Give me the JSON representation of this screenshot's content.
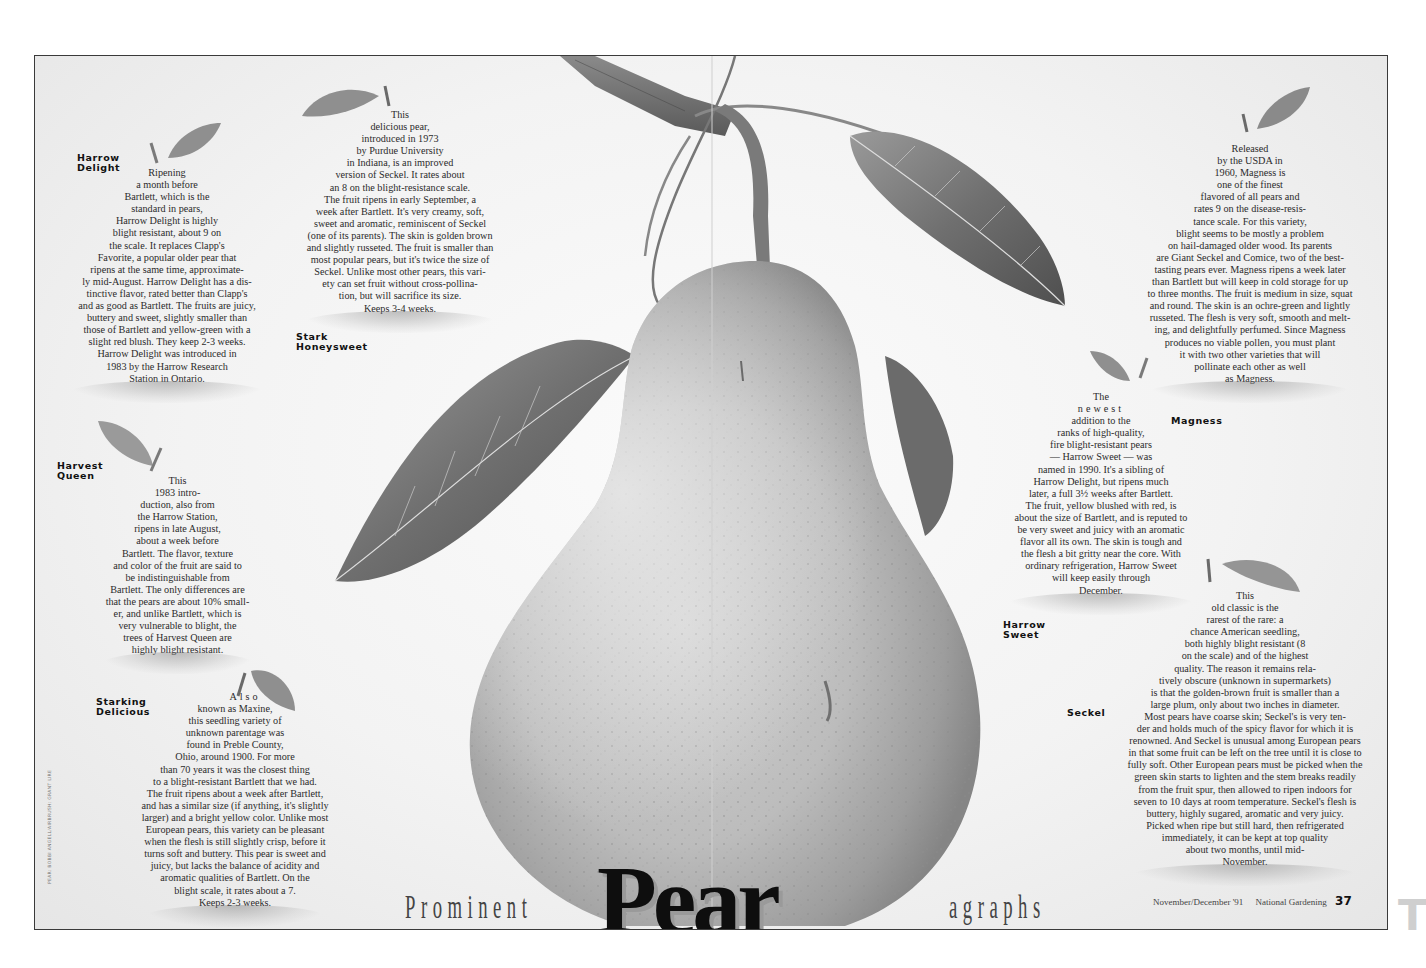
{
  "title": {
    "prefix": "Prominent",
    "main": "Pear",
    "suffix": "agraphs"
  },
  "footer": {
    "issue": "November/December '91",
    "publication": "National Gardening",
    "page_number": "37"
  },
  "credit": "PEAR: BOBBI ANGELL/AIRBRUSH: GRANT LIRE",
  "edge_tab": "T",
  "varieties": [
    {
      "name_lines": [
        "Harrow",
        "Delight"
      ],
      "lines": [
        "Ripening",
        "a month before",
        "Bartlett, which is the",
        "standard in pears,",
        "Harrow Delight is highly",
        "blight resistant, about 9 on",
        "the scale. It replaces Clapp's",
        "Favorite, a popular older pear that",
        "ripens at the same time, approximate-",
        "ly mid-August. Harrow Delight has a dis-",
        "tinctive flavor, rated better than Clapp's",
        "and as good as Bartlett. The fruits are juicy,",
        "buttery and sweet, slightly smaller than",
        "those of Bartlett and yellow-green with a",
        "slight red blush. They keep 2-3 weeks.",
        "Harrow Delight was introduced in",
        "1983 by the Harrow Research",
        "Station in Ontario."
      ]
    },
    {
      "name_lines": [
        "Stark",
        "Honeysweet"
      ],
      "lines": [
        "This",
        "delicious pear,",
        "introduced in 1973",
        "by Purdue University",
        "in Indiana, is an improved",
        "version of Seckel. It rates about",
        "an 8 on the blight-resistance scale.",
        "The fruit ripens in early September, a",
        "week after Bartlett. It's very creamy, soft,",
        "sweet and aromatic, reminiscent of Seckel",
        "(one of its parents). The skin is golden brown",
        "and slightly russeted. The fruit is smaller than",
        "most popular pears, but it's twice the size of",
        "Seckel. Unlike most other pears, this vari-",
        "ety can set fruit without cross-pollina-",
        "tion, but will sacrifice its size.",
        "Keeps 3-4 weeks."
      ]
    },
    {
      "name_lines": [
        "Harvest",
        "Queen"
      ],
      "lines": [
        "This",
        "1983 intro-",
        "duction, also from",
        "the Harrow Station,",
        "ripens in late August,",
        "about a week before",
        "Bartlett. The flavor, texture",
        "and color of the fruit are said to",
        "be indistinguishable from",
        "Bartlett. The only differences are",
        "that the pears are about 10% small-",
        "er, and unlike Bartlett, which is",
        "very vulnerable to blight, the",
        "trees of Harvest Queen are",
        "highly blight resistant."
      ]
    },
    {
      "name_lines": [
        "Starking",
        "Delicious"
      ],
      "lines": [
        "Also",
        "known as Maxine,",
        "this seedling variety of",
        "unknown parentage was",
        "found in Preble County,",
        "Ohio, around 1900. For more",
        "than 70 years it was the closest thing",
        "to a blight-resistant Bartlett that we had.",
        "The fruit ripens about a week after Bartlett,",
        "and has a similar size (if anything, it's slightly",
        "larger) and a bright yellow color. Unlike most",
        "European pears, this variety can be pleasant",
        "when the flesh is still slightly crisp, before it",
        "turns soft and buttery. This pear is sweet and",
        "juicy, but lacks the balance of acidity and",
        "aromatic qualities of Bartlett. On the",
        "blight scale, it rates about a 7.",
        "Keeps 2-3 weeks."
      ]
    },
    {
      "name_lines": [
        "Magness"
      ],
      "lines": [
        "Released",
        "by the USDA in",
        "1960, Magness is",
        "one of the finest",
        "flavored of all pears and",
        "rates 9 on the disease-resis-",
        "tance scale. For this variety,",
        "blight seems to be mostly a problem",
        "on hail-damaged older wood. Its parents",
        "are Giant Seckel and Comice, two of the best-",
        "tasting pears ever. Magness ripens a week later",
        "than Bartlett but will keep in cold storage for up",
        "to three months. The fruit is medium in size, squat",
        "and round. The skin is an ochre-green and lightly",
        "russeted. The flesh is very soft, smooth and melt-",
        "ing, and delightfully perfumed. Since Magness",
        "produces no viable pollen, you must plant",
        "it with two other varieties that will",
        "pollinate each other as well",
        "as Magness."
      ]
    },
    {
      "name_lines": [
        "Harrow",
        "Sweet"
      ],
      "lines": [
        "The",
        "newest",
        "addition to the",
        "ranks of high-quality,",
        "fire blight-resistant pears",
        "— Harrow Sweet — was",
        "named in 1990. It's a sibling of",
        "Harrow Delight, but ripens much",
        "later, a full 3½ weeks after Bartlett.",
        "The fruit, yellow blushed with red, is",
        "about the size of Bartlett, and is reputed to",
        "be very sweet and juicy with an aromatic",
        "flavor all its own. The skin is tough and",
        "the flesh a bit gritty near the core. With",
        "ordinary refrigeration, Harrow Sweet",
        "will keep easily through",
        "December."
      ]
    },
    {
      "name_lines": [
        "Seckel"
      ],
      "lines": [
        "This",
        "old classic is the",
        "rarest of the rare: a",
        "chance American seedling,",
        "both highly blight resistant (8",
        "on the scale) and of the highest",
        "quality. The reason it remains rela-",
        "tively obscure (unknown in supermarkets)",
        "is that the golden-brown fruit is smaller than a",
        "large plum, only about two inches in diameter.",
        "Most pears have coarse skin; Seckel's is very ten-",
        "der and holds much of the spicy flavor for which it is",
        "renowned. And Seckel is unusual among European pears",
        "in that some fruit can be left on the tree until it is close to",
        "fully soft. Other European pears must be picked when the",
        "green skin starts to lighten and the stem breaks readily",
        "from the fruit spur, then allowed to ripen indoors for",
        "seven to 10 days at room temperature. Seckel's flesh is",
        "buttery, highly sugared, aromatic and very juicy.",
        "Picked when ripe but still hard, then refrigerated",
        "immediately, it can be kept at top quality",
        "about two months, until mid-",
        "November."
      ]
    }
  ]
}
